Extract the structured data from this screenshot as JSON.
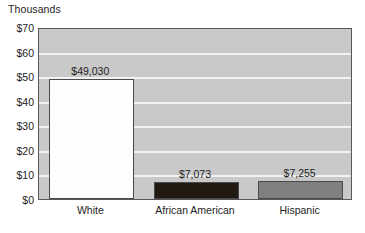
{
  "chart_data": {
    "type": "bar",
    "title": "",
    "subtitle": "",
    "unit_label": "Thousands",
    "xlabel": "",
    "ylabel": "",
    "categories": [
      "White",
      "African American",
      "Hispanic"
    ],
    "values": [
      49030,
      7073,
      7255
    ],
    "value_labels": [
      "$49,030",
      "$7,073",
      "$7,255"
    ],
    "bar_colors": [
      "#fdfdfd",
      "#211a13",
      "#808080"
    ],
    "ylim": [
      0,
      70000
    ],
    "ytick_values": [
      0,
      10000,
      20000,
      30000,
      40000,
      50000,
      60000,
      70000
    ],
    "ytick_labels": [
      "$0",
      "$10",
      "$20",
      "$30",
      "$40",
      "$50",
      "$60",
      "$70"
    ],
    "grid": true,
    "grid_color": "#f2f2f2",
    "plot_background": "#c9c9c9",
    "legend": "none",
    "legend_position": "none",
    "axis_border_color": "#58585a"
  }
}
